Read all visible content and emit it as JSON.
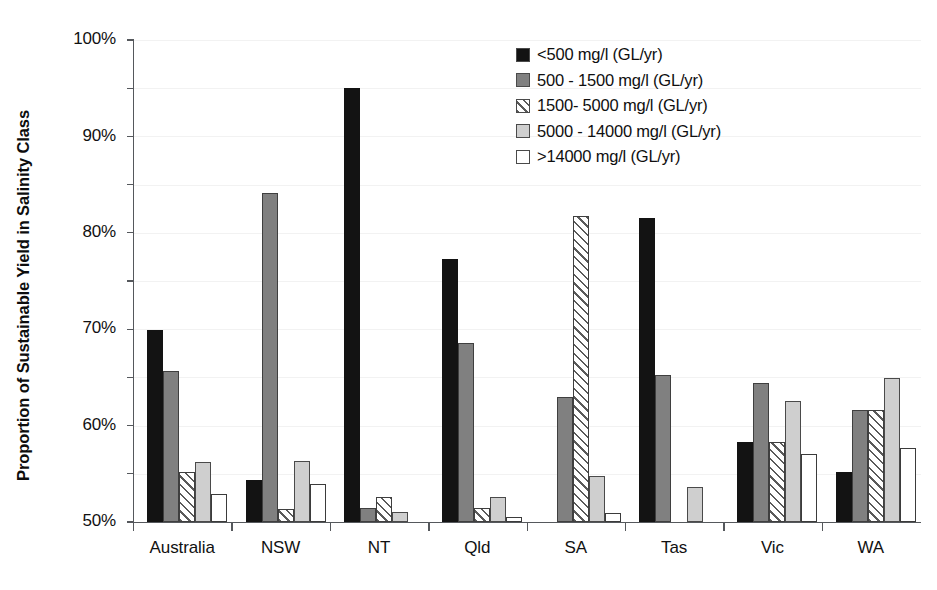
{
  "chart_data": {
    "type": "bar",
    "title": "",
    "xlabel": "",
    "ylabel": "Proportion of Sustainable Yield in Salinity Class",
    "ylim": [
      0,
      100
    ],
    "ytick_labels": [
      "0%",
      "10%",
      "20%",
      "30%",
      "40%",
      "50%",
      "60%",
      "70%",
      "80%",
      "90%",
      "100%"
    ],
    "ytick_values": [
      0,
      10,
      20,
      30,
      40,
      50,
      60,
      70,
      80,
      90,
      100
    ],
    "grid": true,
    "legend_position": "upper right",
    "categories": [
      "Australia",
      "NSW",
      "NT",
      "Qld",
      "SA",
      "Tas",
      "Vic",
      "WA"
    ],
    "series": [
      {
        "name": "<500 mg/l (GL/yr)",
        "values": [
          39.9,
          8.8,
          90.1,
          54.5,
          0,
          63.0,
          16.7,
          10.3
        ]
      },
      {
        "name": "500 - 1500 mg/l (GL/yr)",
        "values": [
          31.4,
          68.3,
          2.9,
          37.2,
          26.0,
          30.6,
          28.8,
          23.2
        ]
      },
      {
        "name": "1500- 5000 mg/l (GL/yr)",
        "values": [
          10.4,
          2.6,
          5.1,
          2.9,
          63.4,
          0,
          16.7,
          23.2
        ]
      },
      {
        "name": "5000 - 14000 mg/l (GL/yr)",
        "values": [
          12.4,
          12.7,
          2.1,
          5.1,
          9.5,
          7.2,
          25.1,
          29.9
        ]
      },
      {
        "name": ">14000 mg/l (GL/yr)",
        "values": [
          5.9,
          7.9,
          0,
          1.0,
          1.9,
          0,
          14.2,
          15.4
        ]
      }
    ]
  },
  "legend": {
    "items": [
      {
        "label": "<500 mg/l (GL/yr)",
        "swatch": "black-solid"
      },
      {
        "label": "500 - 1500 mg/l (GL/yr)",
        "swatch": "gray-solid"
      },
      {
        "label": "1500- 5000 mg/l (GL/yr)",
        "swatch": "diagonal-hatch"
      },
      {
        "label": "5000 - 14000 mg/l (GL/yr)",
        "swatch": "light-gray-solid"
      },
      {
        "label": ">14000 mg/l (GL/yr)",
        "swatch": "white-solid"
      }
    ]
  },
  "colors": {
    "series_0": "#131313",
    "series_1": "#808080",
    "series_2": "#ffffff",
    "series_3": "#cfcfcf",
    "series_4": "#ffffff",
    "axis": "#55585c",
    "grid": "#f2f2f2",
    "text": "#111111"
  }
}
